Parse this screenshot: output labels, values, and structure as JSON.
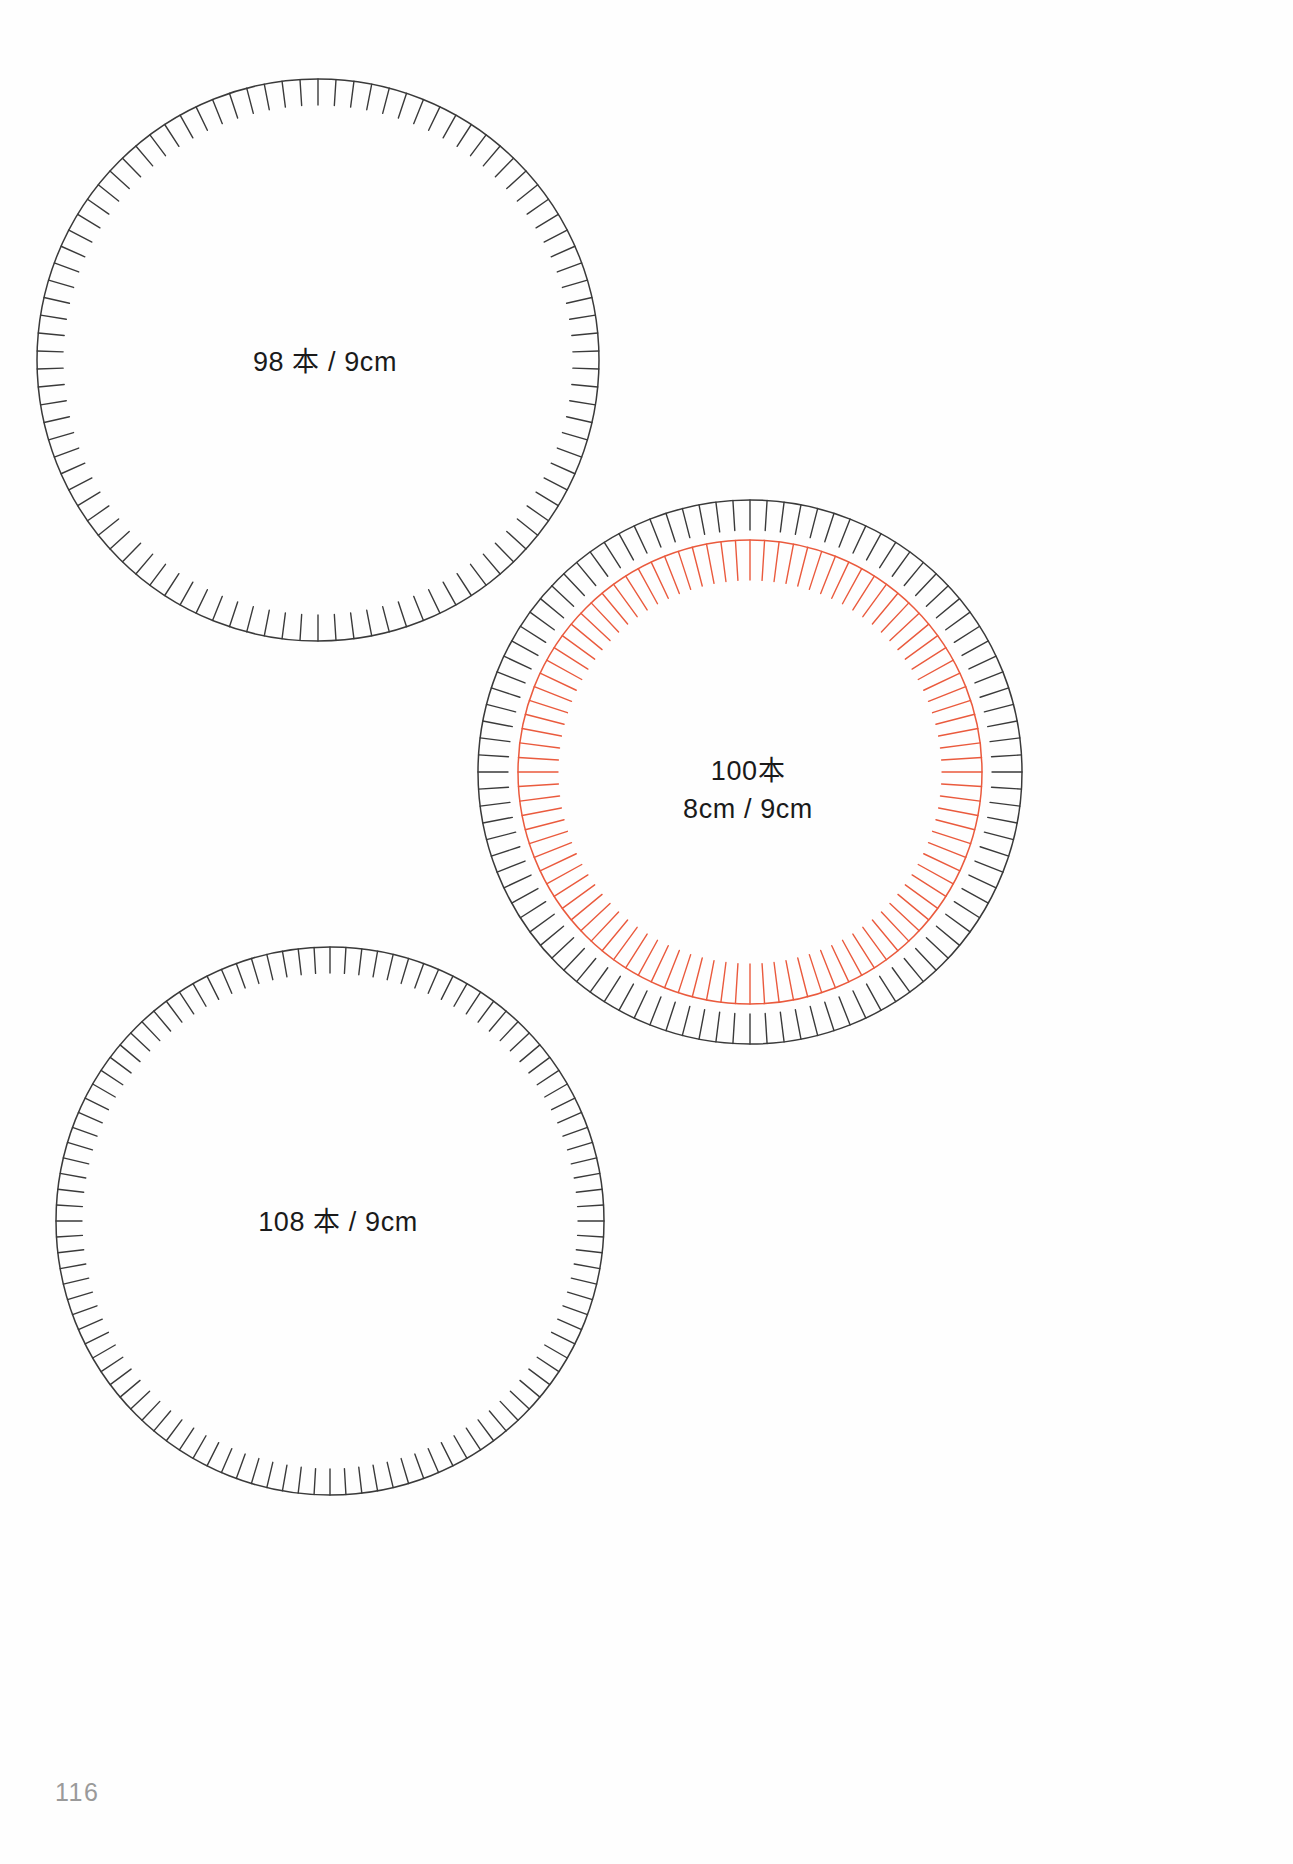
{
  "page": {
    "number": "116",
    "background_color": "#fefefe",
    "width": 1293,
    "height": 1864
  },
  "colors": {
    "outline_black": "#3a3a3a",
    "tick_black": "#4a4a4a",
    "accent_orange": "#ea5a3d",
    "text": "#1a1a1a",
    "page_number": "#9a9a9a"
  },
  "chart_data": {
    "type": "scatter",
    "xlabel": "",
    "ylabel": "",
    "xlim": [
      0,
      1293
    ],
    "ylim": [
      0,
      1864
    ],
    "grid": false,
    "legend": "none",
    "series": [
      {
        "name": "circle-98",
        "label_lines": [
          "98 本 / 9cm"
        ],
        "tick_count": 98,
        "center": [
          318,
          360
        ],
        "radius": 281,
        "tick_length": 26,
        "color": "#3a3a3a",
        "label_center": [
          325,
          362
        ]
      },
      {
        "name": "circle-100-outer",
        "label_lines": [
          "100本",
          "8cm / 9cm"
        ],
        "tick_count": 100,
        "center": [
          750,
          772
        ],
        "radius": 272,
        "tick_length": 30,
        "color": "#3a3a3a",
        "label_center": [
          748,
          790
        ]
      },
      {
        "name": "circle-100-inner",
        "label_lines": [],
        "tick_count": 100,
        "center": [
          750,
          772
        ],
        "radius": 232,
        "tick_length": 40,
        "color": "#ea5a3d",
        "label_center": null
      },
      {
        "name": "circle-108",
        "label_lines": [
          "108 本 / 9cm"
        ],
        "tick_count": 108,
        "center": [
          330,
          1221
        ],
        "radius": 274,
        "tick_length": 26,
        "color": "#3a3a3a",
        "label_center": [
          338,
          1222
        ]
      }
    ]
  },
  "circles": [
    {
      "id": "circle-98",
      "label": "98 本 / 9cm",
      "label_lines": [
        "98 本 / 9cm"
      ],
      "count": "98",
      "unit": "本",
      "size": "9cm"
    },
    {
      "id": "circle-100",
      "label": "100本 8cm / 9cm",
      "label_lines": [
        "100本",
        "8cm / 9cm"
      ],
      "count": "100",
      "unit": "本",
      "inner_size": "8cm",
      "outer_size": "9cm"
    },
    {
      "id": "circle-108",
      "label": "108 本 / 9cm",
      "label_lines": [
        "108 本 / 9cm"
      ],
      "count": "108",
      "unit": "本",
      "size": "9cm"
    }
  ],
  "labels": {
    "circle_98_line1": "98 本 / 9cm",
    "circle_100_line1": "100本",
    "circle_100_line2": "8cm / 9cm",
    "circle_108_line1": "108 本 / 9cm"
  }
}
